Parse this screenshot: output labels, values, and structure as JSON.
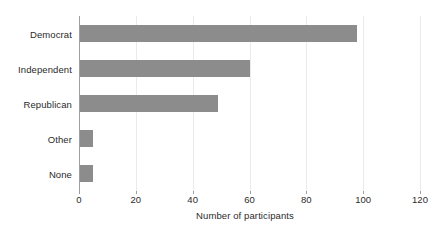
{
  "chart_data": {
    "type": "bar",
    "orientation": "horizontal",
    "title": "",
    "subtitle": "",
    "xlabel": "Number of participants",
    "ylabel": "",
    "categories": [
      "Democrat",
      "Independent",
      "Republican",
      "Other",
      "None"
    ],
    "values": [
      98,
      60,
      49,
      5,
      5
    ],
    "series": [
      {
        "name": "Number of participants",
        "values": [
          98,
          60,
          49,
          5,
          5
        ]
      }
    ],
    "xlim": [
      0,
      120
    ],
    "xticks": [
      0,
      20,
      40,
      60,
      80,
      100,
      120
    ],
    "xtick_labels": [
      "0",
      "20",
      "40",
      "60",
      "80",
      "100",
      "120"
    ],
    "grid": true,
    "grid_axis": "x",
    "legend": false,
    "legend_position": "none",
    "annotations": []
  },
  "style": {
    "bar_color": "#8c8c8c",
    "grid_color": "#e9eaec",
    "axis_color": "#9aa0a6",
    "text_color": "#2b2b2b",
    "background": "#ffffff"
  }
}
